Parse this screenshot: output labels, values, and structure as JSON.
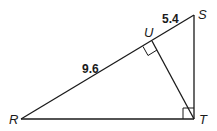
{
  "diagram": {
    "type": "right-triangle-with-altitude",
    "vertices": {
      "R": {
        "label": "R",
        "x": 21,
        "y": 119
      },
      "S": {
        "label": "S",
        "x": 194,
        "y": 15
      },
      "T": {
        "label": "T",
        "x": 194,
        "y": 119
      },
      "U": {
        "label": "U",
        "x": 152,
        "y": 41
      }
    },
    "segments": [
      {
        "name": "RS",
        "from": "R",
        "to": "S"
      },
      {
        "name": "ST",
        "from": "S",
        "to": "T"
      },
      {
        "name": "RT",
        "from": "R",
        "to": "T"
      },
      {
        "name": "TU",
        "from": "T",
        "to": "U"
      }
    ],
    "measurements": {
      "RU": "9.6",
      "US": "5.4"
    },
    "right_angles": [
      "U",
      "T"
    ],
    "colors": {
      "stroke": "#1a1a1a",
      "background": "#ffffff"
    }
  }
}
